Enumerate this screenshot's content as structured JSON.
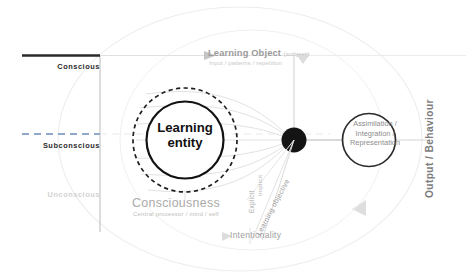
{
  "diagram": {
    "levels": [
      {
        "id": "conscious",
        "label": "Conscious",
        "line": "solid",
        "color": "#2b2b2b"
      },
      {
        "id": "subconscious",
        "label": "Subconscious",
        "line": "dashed",
        "color": "#8ea9c9"
      },
      {
        "id": "unconscious",
        "label": "Unconscious",
        "line": "none",
        "color": "#d2d2d2"
      }
    ],
    "entity": {
      "line1": "Learning",
      "line2": "entity",
      "outer_ring": "dashed"
    },
    "consciousness": {
      "title": "Consciousness",
      "subtitle": "Central processor / mind / self"
    },
    "learning_object": {
      "title": "Learning Object",
      "tag": "(subject)",
      "subtitle": "Input / patterns / repetition"
    },
    "assimilation": {
      "line1": "Assimilation /",
      "line2": "Integration /",
      "line3": "Representation"
    },
    "output": {
      "label": "Output / Behaviour"
    },
    "intentionality": {
      "label": "Intentionality"
    },
    "axes": {
      "implicit": "Implicit",
      "explicit": "Explicit",
      "learning_objective": "Learning objective"
    },
    "colors": {
      "ink": "#2b2b2b",
      "node": "#1a1a1a",
      "faint": "#e3e3e3",
      "mid_grey": "#9a9a9a",
      "blue_dash": "#8ea9c9",
      "arrow": "#d8d8d8"
    }
  }
}
